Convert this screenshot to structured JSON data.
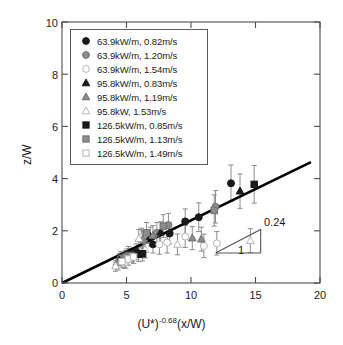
{
  "chart_data": {
    "type": "scatter",
    "title": "",
    "xlabel": "(U*)-0.68(x/W)",
    "xlabel_base": "(U*)",
    "xlabel_exponent": "-0.68",
    "xlabel_tail": "(x/W)",
    "ylabel": "z/W",
    "xlim": [
      0,
      20
    ],
    "ylim": [
      0,
      10
    ],
    "xticks": [
      "0",
      "5",
      "10",
      "15",
      "20"
    ],
    "yticks": [
      "0",
      "2",
      "4",
      "6",
      "8",
      "10"
    ],
    "grid": false,
    "legend_position": "upper-left-inside",
    "fit_line": {
      "label": "linear fit",
      "slope": 0.24,
      "intercept": 0.0,
      "x_start": 0,
      "x_end": 19.3
    },
    "slope_triangle": {
      "rise_label": "0.24",
      "run_label": "1",
      "x_left": 11.9,
      "x_right": 15.4,
      "y_bottom": 1.15,
      "y_top": 2.05
    },
    "series": [
      {
        "name": "63.9kW/m, 0.82m/s",
        "marker": "circle-filled",
        "color": "#1a1a1a",
        "points": [
          {
            "x": 5.15,
            "y": 1.12,
            "err": 0.28
          },
          {
            "x": 5.75,
            "y": 1.2,
            "err": 0.3
          },
          {
            "x": 7.05,
            "y": 1.48,
            "err": 0.33
          },
          {
            "x": 8.35,
            "y": 1.9,
            "err": 0.4
          },
          {
            "x": 9.55,
            "y": 2.36,
            "err": 0.48
          },
          {
            "x": 10.6,
            "y": 2.52,
            "err": 0.55
          },
          {
            "x": 13.1,
            "y": 3.82,
            "err": 0.7
          }
        ]
      },
      {
        "name": "63.9kW/m, 1.20m/s",
        "marker": "circle-gray",
        "color": "#8c8c8c",
        "points": [
          {
            "x": 4.55,
            "y": 0.95,
            "err": 0.25
          },
          {
            "x": 5.05,
            "y": 1.05,
            "err": 0.26
          },
          {
            "x": 6.35,
            "y": 1.62,
            "err": 0.34
          },
          {
            "x": 7.35,
            "y": 1.92,
            "err": 0.4
          },
          {
            "x": 8.25,
            "y": 2.22,
            "err": 0.45
          },
          {
            "x": 11.9,
            "y": 2.92,
            "err": 0.62
          }
        ]
      },
      {
        "name": "63.9kW/m, 1.54m/s",
        "marker": "circle-open",
        "color": "#b5b5b5",
        "points": [
          {
            "x": 4.35,
            "y": 0.72,
            "err": 0.22
          },
          {
            "x": 4.95,
            "y": 0.82,
            "err": 0.24
          },
          {
            "x": 6.15,
            "y": 1.74,
            "err": 0.36
          },
          {
            "x": 7.55,
            "y": 1.48,
            "err": 0.38
          },
          {
            "x": 8.15,
            "y": 1.55,
            "err": 0.4
          },
          {
            "x": 9.55,
            "y": 1.78,
            "err": 0.42
          },
          {
            "x": 11.0,
            "y": 1.42,
            "err": 0.45
          },
          {
            "x": 12.0,
            "y": 1.52,
            "err": 0.45
          }
        ]
      },
      {
        "name": "95.8kW/m, 0.83m/s",
        "marker": "triangle-filled",
        "color": "#1a1a1a",
        "points": [
          {
            "x": 4.45,
            "y": 0.88,
            "err": 0.24
          },
          {
            "x": 5.25,
            "y": 1.05,
            "err": 0.26
          },
          {
            "x": 6.85,
            "y": 1.78,
            "err": 0.36
          },
          {
            "x": 7.65,
            "y": 1.95,
            "err": 0.4
          },
          {
            "x": 13.8,
            "y": 3.52,
            "err": 0.66
          }
        ]
      },
      {
        "name": "95.8kW/m, 1.19m/s",
        "marker": "triangle-gray",
        "color": "#8c8c8c",
        "points": [
          {
            "x": 4.25,
            "y": 0.78,
            "err": 0.22
          },
          {
            "x": 5.05,
            "y": 0.95,
            "err": 0.25
          },
          {
            "x": 6.25,
            "y": 1.68,
            "err": 0.35
          },
          {
            "x": 7.05,
            "y": 1.82,
            "err": 0.38
          },
          {
            "x": 10.1,
            "y": 1.72,
            "err": 0.44
          },
          {
            "x": 10.8,
            "y": 1.68,
            "err": 0.46
          }
        ]
      },
      {
        "name": "95.8kW, 1.53m/s",
        "marker": "triangle-open",
        "color": "#b5b5b5",
        "points": [
          {
            "x": 4.15,
            "y": 0.65,
            "err": 0.2
          },
          {
            "x": 4.85,
            "y": 0.78,
            "err": 0.22
          },
          {
            "x": 5.95,
            "y": 1.7,
            "err": 0.35
          },
          {
            "x": 6.45,
            "y": 1.28,
            "err": 0.32
          },
          {
            "x": 8.95,
            "y": 1.48,
            "err": 0.4
          },
          {
            "x": 14.6,
            "y": 1.62,
            "err": 0.46
          }
        ]
      },
      {
        "name": "126.5kW/m, 0.85m/s",
        "marker": "square-filled",
        "color": "#1a1a1a",
        "points": [
          {
            "x": 5.45,
            "y": 1.08,
            "err": 0.26
          },
          {
            "x": 5.95,
            "y": 1.1,
            "err": 0.28
          },
          {
            "x": 6.25,
            "y": 1.12,
            "err": 0.28
          },
          {
            "x": 14.9,
            "y": 3.78,
            "err": 0.72
          }
        ]
      },
      {
        "name": "126.5kW/m, 1.13m/s",
        "marker": "square-gray",
        "color": "#8c8c8c",
        "points": [
          {
            "x": 4.95,
            "y": 1.0,
            "err": 0.25
          },
          {
            "x": 5.35,
            "y": 1.05,
            "err": 0.26
          },
          {
            "x": 6.55,
            "y": 1.92,
            "err": 0.4
          },
          {
            "x": 7.85,
            "y": 2.18,
            "err": 0.44
          },
          {
            "x": 11.8,
            "y": 2.78,
            "err": 0.6
          }
        ]
      },
      {
        "name": "126.5kW/m, 1.49m/s",
        "marker": "square-open",
        "color": "#b5b5b5",
        "points": [
          {
            "x": 4.65,
            "y": 0.82,
            "err": 0.23
          },
          {
            "x": 5.15,
            "y": 0.92,
            "err": 0.24
          },
          {
            "x": 5.55,
            "y": 1.0,
            "err": 0.25
          }
        ]
      }
    ]
  },
  "legend": {
    "entries": [
      {
        "label": "63.9kW/m, 0.82m/s",
        "marker": "circle-filled"
      },
      {
        "label": "63.9kW/m, 1.20m/s",
        "marker": "circle-gray"
      },
      {
        "label": "63.9kW/m, 1.54m/s",
        "marker": "circle-open"
      },
      {
        "label": "95.8kW/m, 0.83m/s",
        "marker": "triangle-filled"
      },
      {
        "label": "95.8kW/m, 1.19m/s",
        "marker": "triangle-gray"
      },
      {
        "label": "95.8kW, 1.53m/s",
        "marker": "triangle-open"
      },
      {
        "label": "126.5kW/m, 0.85m/s",
        "marker": "square-filled"
      },
      {
        "label": "126.5kW/m, 1.13m/s",
        "marker": "square-gray"
      },
      {
        "label": "126.5kW/m, 1.49m/s",
        "marker": "square-open"
      }
    ]
  },
  "colors": {
    "filled": "#1a1a1a",
    "gray": "#8c8c8c",
    "open_stroke": "#b5b5b5",
    "axis": "#4d4d4d",
    "fit_line": "#000000",
    "errorbar": "#8c8c8c"
  }
}
